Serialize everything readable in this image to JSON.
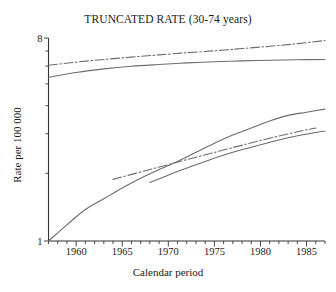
{
  "chart_data": {
    "type": "line",
    "title": "TRUNCATED RATE (30-74 years)",
    "xlabel": "Calendar period",
    "ylabel": "Rate per 100 000",
    "xlim": [
      1957,
      1987
    ],
    "ylim": [
      1,
      8
    ],
    "yscale": "log",
    "grid": false,
    "legend": "none",
    "xticks": [
      1960,
      1965,
      1970,
      1975,
      1980,
      1985
    ],
    "xtick_labels": [
      "1960",
      "1965",
      "1970",
      "1975",
      "1980",
      "1985"
    ],
    "yticks": [
      1,
      8
    ],
    "ytick_labels": [
      "1",
      "8"
    ],
    "minor_yticks": [
      2,
      3,
      4,
      5,
      6,
      7
    ],
    "minor_xtick_interval": 1,
    "series": [
      {
        "name": "upper-dashdot",
        "style": "dashdot",
        "x": [
          1957,
          1960,
          1963,
          1966,
          1969,
          1972,
          1975,
          1978,
          1981,
          1984,
          1987
        ],
        "y": [
          6.05,
          6.25,
          6.42,
          6.58,
          6.73,
          6.88,
          7.02,
          7.18,
          7.35,
          7.55,
          7.8
        ]
      },
      {
        "name": "upper-solid",
        "style": "solid",
        "x": [
          1957,
          1960,
          1963,
          1966,
          1969,
          1972,
          1975,
          1978,
          1981,
          1984,
          1987
        ],
        "y": [
          5.35,
          5.62,
          5.83,
          5.99,
          6.1,
          6.2,
          6.27,
          6.33,
          6.37,
          6.4,
          6.42
        ]
      },
      {
        "name": "lower-steep-solid",
        "style": "solid",
        "x": [
          1957,
          1959,
          1961,
          1963,
          1965,
          1967,
          1969,
          1971,
          1973,
          1975,
          1977,
          1979,
          1981,
          1983,
          1985,
          1987
        ],
        "y": [
          1.0,
          1.18,
          1.38,
          1.54,
          1.72,
          1.9,
          2.08,
          2.26,
          2.48,
          2.72,
          2.96,
          3.18,
          3.42,
          3.62,
          3.74,
          3.86
        ]
      },
      {
        "name": "lower-dashdot",
        "style": "dashdot",
        "x": [
          1964,
          1968,
          1972,
          1976,
          1980,
          1984,
          1986
        ],
        "y": [
          1.88,
          2.08,
          2.3,
          2.54,
          2.8,
          3.06,
          3.18
        ]
      },
      {
        "name": "lower-flat-solid",
        "style": "solid",
        "x": [
          1968,
          1971,
          1974,
          1977,
          1980,
          1983,
          1986,
          1987
        ],
        "y": [
          1.82,
          2.04,
          2.26,
          2.48,
          2.68,
          2.88,
          3.04,
          3.08
        ]
      }
    ]
  }
}
